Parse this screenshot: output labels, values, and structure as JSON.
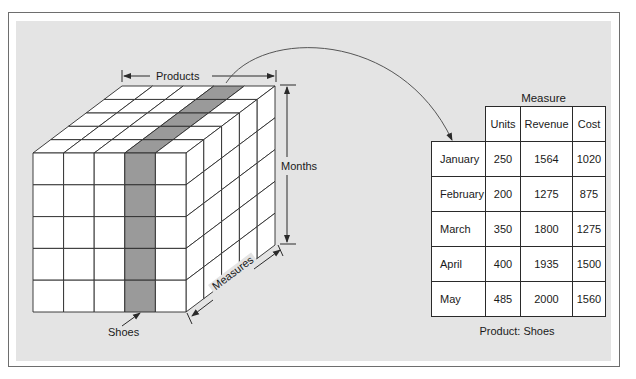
{
  "diagram": {
    "cube": {
      "axis_labels": {
        "products": "Products",
        "months": "Months",
        "measures": "Measures"
      },
      "highlighted_slice_label": "Shoes",
      "grid": {
        "columns": 5,
        "rows": 5,
        "depth": 5,
        "highlighted_column": 4
      },
      "colors": {
        "cell_fill": "#ffffff",
        "highlight_fill": "#9a9a9a",
        "line": "#2a2a2a",
        "background": "#e4e4e4"
      }
    },
    "slice_table": {
      "title": "Measure",
      "columns": [
        "Units",
        "Revenue",
        "Cost"
      ],
      "rows": [
        {
          "month": "January",
          "units": "250",
          "revenue": "1564",
          "cost": "1020"
        },
        {
          "month": "February",
          "units": "200",
          "revenue": "1275",
          "cost": "875"
        },
        {
          "month": "March",
          "units": "350",
          "revenue": "1800",
          "cost": "1275"
        },
        {
          "month": "April",
          "units": "400",
          "revenue": "1935",
          "cost": "1500"
        },
        {
          "month": "May",
          "units": "485",
          "revenue": "2000",
          "cost": "1560"
        }
      ],
      "caption": "Product: Shoes"
    }
  }
}
